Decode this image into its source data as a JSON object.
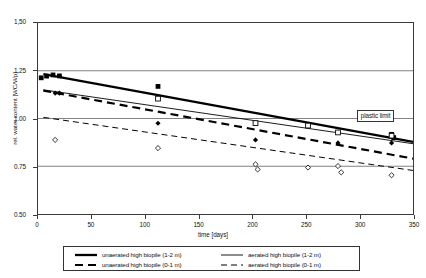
{
  "chart_data": {
    "type": "scatter",
    "title": "",
    "xlabel": "time [days]",
    "ylabel": "rel. water content [WC/Wp]",
    "xlim": [
      0,
      350
    ],
    "ylim": [
      0.5,
      1.5
    ],
    "xticks": [
      "0",
      "50",
      "100",
      "150",
      "200",
      "250",
      "300",
      "350"
    ],
    "xtick_values": [
      0,
      50,
      100,
      150,
      200,
      250,
      300,
      350
    ],
    "yticks": [
      "1,50",
      "1.25",
      "1.00",
      "0.75",
      "0.50"
    ],
    "ytick_values": [
      1.5,
      1.25,
      1.0,
      0.75,
      0.5
    ],
    "grid": "horizontal",
    "gridlines": [
      1.25,
      1.0,
      0.75
    ],
    "legend_position": "bottom",
    "annotations": [
      {
        "text": "plastic limit",
        "x": 330,
        "y": 1.0
      }
    ],
    "series": [
      {
        "name": "unaerated high biopile (1-2 m)",
        "style": "thick-solid",
        "color": "#000000",
        "trendline": {
          "x": [
            5,
            350
          ],
          "y": [
            1.232,
            0.878
          ]
        },
        "marker": "filled-square",
        "points": [
          {
            "x": 3,
            "y": 1.213
          },
          {
            "x": 8,
            "y": 1.222
          },
          {
            "x": 14,
            "y": 1.228
          },
          {
            "x": 20,
            "y": 1.223
          },
          {
            "x": 112,
            "y": 1.168
          },
          {
            "x": 330,
            "y": 0.917
          },
          {
            "x": 332,
            "y": 0.9
          }
        ]
      },
      {
        "name": "aerated high biopile (1-2 m)",
        "style": "thin-solid",
        "color": "#000000",
        "trendline": {
          "x": [
            5,
            350
          ],
          "y": [
            1.15,
            0.868
          ]
        },
        "marker": "open-square",
        "points": [
          {
            "x": 112,
            "y": 1.104
          },
          {
            "x": 203,
            "y": 0.976
          },
          {
            "x": 252,
            "y": 0.963
          },
          {
            "x": 280,
            "y": 0.927
          },
          {
            "x": 330,
            "y": 0.91
          }
        ]
      },
      {
        "name": "unaerated high biopile (0-1 m)",
        "style": "thick-dashed",
        "color": "#000000",
        "trendline": {
          "x": [
            5,
            350
          ],
          "y": [
            1.146,
            0.79
          ]
        },
        "marker": "filled-diamond",
        "points": [
          {
            "x": 16,
            "y": 1.133
          },
          {
            "x": 20,
            "y": 1.133
          },
          {
            "x": 112,
            "y": 0.975
          },
          {
            "x": 203,
            "y": 0.888
          },
          {
            "x": 280,
            "y": 0.872
          },
          {
            "x": 330,
            "y": 0.872
          }
        ]
      },
      {
        "name": "aerated high biopile (0-1 m)",
        "style": "thin-dashed",
        "color": "#000000",
        "trendline": {
          "x": [
            5,
            350
          ],
          "y": [
            1.006,
            0.728
          ]
        },
        "marker": "open-diamond",
        "points": [
          {
            "x": 16,
            "y": 0.888
          },
          {
            "x": 112,
            "y": 0.845
          },
          {
            "x": 203,
            "y": 0.76
          },
          {
            "x": 205,
            "y": 0.733
          },
          {
            "x": 252,
            "y": 0.743
          },
          {
            "x": 280,
            "y": 0.751
          },
          {
            "x": 283,
            "y": 0.718
          },
          {
            "x": 330,
            "y": 0.703
          }
        ]
      }
    ]
  },
  "legend": {
    "entries": [
      {
        "label": "unaerated high biopile (1-2 m)",
        "style": "thick-solid"
      },
      {
        "label": "aerated high biopile (1-2 m)",
        "style": "thin-solid"
      },
      {
        "label": "unaerated high biopile (0-1 m)",
        "style": "thick-dashed"
      },
      {
        "label": "aerated high biopile (0-1 m)",
        "style": "thin-dashed"
      }
    ]
  }
}
